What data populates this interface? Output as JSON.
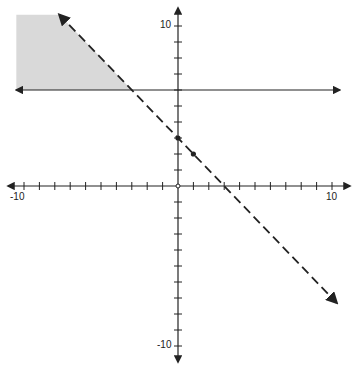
{
  "chart_data": {
    "type": "line",
    "title": "",
    "xlabel": "",
    "ylabel": "",
    "xlim": [
      -10,
      10
    ],
    "ylim": [
      -10,
      10
    ],
    "grid": false,
    "x_tick_labels": [
      "-10",
      "10"
    ],
    "y_tick_labels": [
      "10",
      "-10"
    ],
    "series": [
      {
        "name": "boundary y = -x + 3",
        "style": "dashed",
        "slope": -1,
        "intercept": 3,
        "points": [
          [
            0,
            3
          ],
          [
            1,
            2
          ]
        ],
        "x_range": [
          -7.7,
          10.3
        ]
      },
      {
        "name": "boundary y = 6",
        "style": "solid",
        "slope": 0,
        "intercept": 6,
        "x_range": [
          -10.5,
          10.5
        ]
      }
    ],
    "shaded_region": {
      "description": "y >= 6 and y < -x + 3",
      "vertices": [
        [
          -10.5,
          6
        ],
        [
          -3,
          6
        ],
        [
          -7.7,
          10.7
        ],
        [
          -10.5,
          10.7
        ]
      ],
      "color": "#d9d9d9"
    },
    "colors": {
      "axis": "#222222",
      "line": "#222222",
      "shade": "#d9d9d9"
    }
  },
  "labels": {
    "x_min": "-10",
    "x_max": "10",
    "y_max": "10",
    "y_min": "-10"
  }
}
